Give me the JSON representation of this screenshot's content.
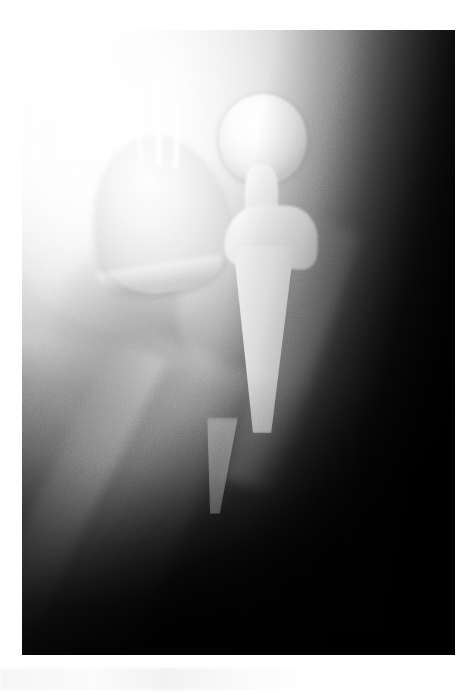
{
  "document": {
    "type": "radiograph",
    "modality": "X-ray",
    "view": "anteroposterior-hip",
    "caption": ""
  },
  "image": {
    "frame": {
      "left_px": 22,
      "top_px": 30,
      "width_px": 433,
      "height_px": 625
    },
    "background_color": "#ffffff",
    "film_dark_color": "#060606",
    "film_bright_color": "#ffffff",
    "implant_color": "#fafafa",
    "bone_color": "#b8b8b8"
  },
  "anatomy": {
    "regions": [
      {
        "name": "ilium",
        "label": "Iliac wing"
      },
      {
        "name": "ischium-shadow",
        "label": "Obturator / ischial shadow"
      },
      {
        "name": "calcar",
        "label": "Medial calcar femorale"
      },
      {
        "name": "lateral-cortex",
        "label": "Greater trochanter / lateral cortex"
      },
      {
        "name": "medial-cortex",
        "label": "Medial femoral cortex"
      },
      {
        "name": "femoral-shaft",
        "label": "Femoral diaphysis"
      },
      {
        "name": "thigh-edge",
        "label": "Thigh soft-tissue margin"
      }
    ]
  },
  "implant": {
    "name": "Total hip arthroplasty",
    "components": [
      {
        "name": "acetabular-cup",
        "label": "Acetabular metal shell"
      },
      {
        "name": "cup-rim",
        "label": "Acetabular liner rim"
      },
      {
        "name": "femoral-head",
        "label": "Modular femoral head"
      },
      {
        "name": "femoral-neck",
        "label": "Prosthetic neck"
      },
      {
        "name": "stem-collar",
        "label": "Stem shoulder / collar"
      },
      {
        "name": "stem-body",
        "label": "Femoral stem body"
      },
      {
        "name": "stem-tip",
        "label": "Distal stem tip"
      }
    ],
    "screws": [
      {
        "name": "screw-1",
        "label": "Acetabular screw 1"
      },
      {
        "name": "screw-2",
        "label": "Acetabular screw 2"
      },
      {
        "name": "screw-3",
        "label": "Acetabular screw 3"
      }
    ],
    "screw_count": 3
  }
}
